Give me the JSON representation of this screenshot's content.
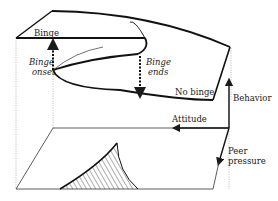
{
  "diagram": {
    "type": "cusp-catastrophe",
    "labels": {
      "binge": "Binge",
      "binge_onset_line1": "Binge",
      "binge_onset_line2": "onset",
      "binge_ends_line1": "Binge",
      "binge_ends_line2": "ends",
      "no_binge": "No binge",
      "behavior": "Behavior",
      "attitude": "Attitude",
      "peer_pressure_line1": "Peer",
      "peer_pressure_line2": "pressure"
    },
    "axes": [
      {
        "name": "Behavior",
        "direction": "up"
      },
      {
        "name": "Attitude",
        "direction": "left"
      },
      {
        "name": "Peer pressure",
        "direction": "down-forward"
      }
    ],
    "colors": {
      "line": "#1a1a1a",
      "dotted": "#888888",
      "background": "#ffffff"
    }
  }
}
